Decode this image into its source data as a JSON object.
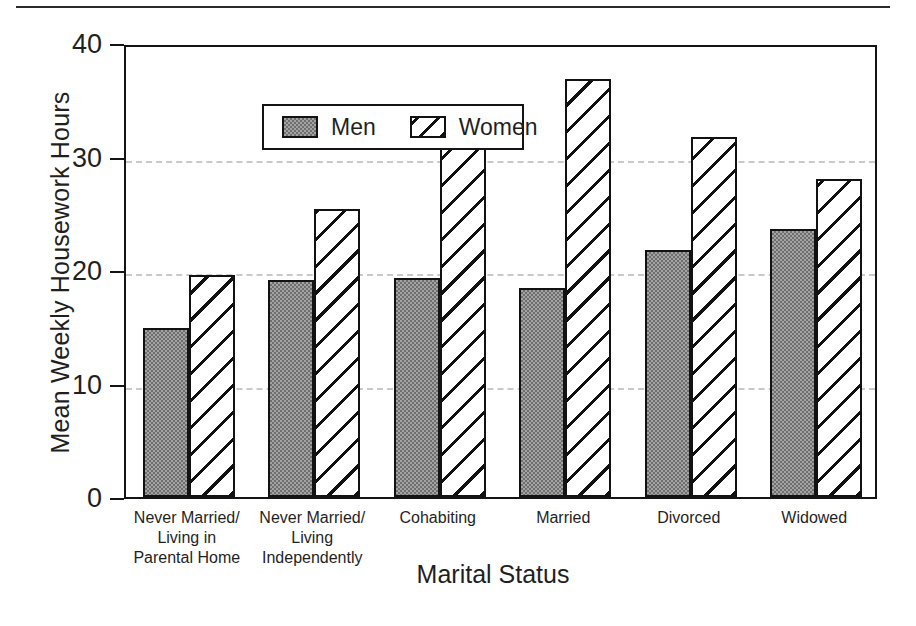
{
  "chart_data": {
    "type": "bar",
    "title": "",
    "xlabel": "Marital Status",
    "ylabel": "Mean Weekly Housework Hours",
    "categories": [
      "Never Married/\nLiving in\nParental Home",
      "Never Married/\nLiving\nIndependently",
      "Cohabiting",
      "Married",
      "Divorced",
      "Widowed"
    ],
    "category_lines": [
      [
        "Never Married/",
        "Living in",
        "Parental Home"
      ],
      [
        "Never Married/",
        "Living",
        "Independently"
      ],
      [
        "Cohabiting"
      ],
      [
        "Married"
      ],
      [
        "Divorced"
      ],
      [
        "Widowed"
      ]
    ],
    "series": [
      {
        "name": "Men",
        "values": [
          14.9,
          19.1,
          19.3,
          18.4,
          21.8,
          23.6
        ]
      },
      {
        "name": "Women",
        "values": [
          19.6,
          25.4,
          31.4,
          36.8,
          31.7,
          28.0
        ]
      }
    ],
    "ylim": [
      0,
      40
    ],
    "yticks": [
      0,
      10,
      20,
      30,
      40
    ],
    "ytick_labels": [
      "0",
      "10",
      "20",
      "30",
      "40"
    ],
    "yticks_minor": [
      5,
      15,
      25,
      35
    ],
    "gridlines": [
      10,
      20,
      30
    ],
    "grid": true,
    "legend": {
      "position": "top-left",
      "entries": [
        "Men",
        "Women"
      ]
    },
    "colors": {
      "men_fill": "#a3a3a3",
      "men_pattern": "#6e6e6e",
      "women_fill": "#ffffff",
      "women_hatch": "#111111",
      "axis": "#141414",
      "grid": "#c9c9c9",
      "text": "#1f1f1f"
    }
  },
  "legend": {
    "men_label": "Men",
    "women_label": "Women"
  },
  "axes": {
    "y_title": "Mean Weekly Housework Hours",
    "x_title": "Marital Status"
  }
}
